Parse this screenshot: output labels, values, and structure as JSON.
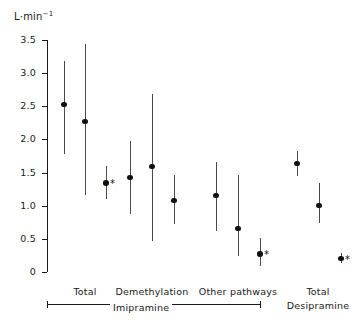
{
  "chart_data": {
    "type": "scatter",
    "title": "",
    "subtitle": "",
    "xlabel": "",
    "ylabel": "L·min⁻¹",
    "ylim": [
      0,
      3.5
    ],
    "yticks": [
      "0",
      "0.5",
      "1.0",
      "1.5",
      "2.0",
      "2.5",
      "3.0",
      "3.5"
    ],
    "ytick_values": [
      0,
      0.5,
      1.0,
      1.5,
      2.0,
      2.5,
      3.0,
      3.5
    ],
    "grid": false,
    "legend": "none",
    "error_bar_style": "vertical line, mean with range",
    "significance_marker": "*",
    "categories": [
      "Total",
      "Demethylation",
      "Other pathways",
      "Total"
    ],
    "group_brackets": [
      {
        "label": "Imipramine",
        "categories": [
          "Total",
          "Demethylation",
          "Other pathways"
        ]
      },
      {
        "label": "Desipramine",
        "categories": [
          "Total"
        ]
      }
    ],
    "series": [
      {
        "name": "Imipramine — Total",
        "points": [
          {
            "index": 1,
            "value": 2.53,
            "low": 1.78,
            "high": 3.19,
            "marker": "circle",
            "significant": false
          },
          {
            "index": 2,
            "value": 2.27,
            "low": 1.16,
            "high": 3.44,
            "marker": "circle",
            "significant": false
          },
          {
            "index": 3,
            "value": 1.34,
            "low": 1.1,
            "high": 1.6,
            "marker": "circle",
            "significant": true
          }
        ]
      },
      {
        "name": "Imipramine — Demethylation",
        "points": [
          {
            "index": 1,
            "value": 1.43,
            "low": 0.88,
            "high": 1.97,
            "marker": "circle",
            "significant": false
          },
          {
            "index": 2,
            "value": 1.59,
            "low": 0.46,
            "high": 2.68,
            "marker": "circle",
            "significant": false
          },
          {
            "index": 3,
            "value": 1.08,
            "low": 0.72,
            "high": 1.47,
            "marker": "circle",
            "significant": false
          }
        ]
      },
      {
        "name": "Imipramine — Other pathways",
        "points": [
          {
            "index": 1,
            "value": 1.15,
            "low": 0.62,
            "high": 1.66,
            "marker": "circle",
            "significant": false
          },
          {
            "index": 2,
            "value": 0.66,
            "low": 0.24,
            "high": 1.47,
            "marker": "circle",
            "significant": false
          },
          {
            "index": 3,
            "value": 0.27,
            "low": 0.09,
            "high": 0.52,
            "marker": "circle",
            "significant": true
          }
        ]
      },
      {
        "name": "Desipramine — Total",
        "points": [
          {
            "index": 1,
            "value": 1.64,
            "low": 1.45,
            "high": 1.83,
            "marker": "circle",
            "significant": false
          },
          {
            "index": 2,
            "value": 1.0,
            "low": 0.74,
            "high": 1.35,
            "marker": "circle",
            "significant": false
          },
          {
            "index": 3,
            "value": 0.2,
            "low": 0.13,
            "high": 0.28,
            "marker": "circle",
            "significant": true
          }
        ]
      }
    ]
  },
  "axis": {
    "unit_label": "L·min",
    "unit_exponent": "−1",
    "ticks": [
      {
        "label": "3.5",
        "value": 3.5
      },
      {
        "label": "3.0",
        "value": 3.0
      },
      {
        "label": "2.5",
        "value": 2.5
      },
      {
        "label": "2.0",
        "value": 2.0
      },
      {
        "label": "1.5",
        "value": 1.5
      },
      {
        "label": "1.0",
        "value": 1.0
      },
      {
        "label": "0.5",
        "value": 0.5
      },
      {
        "label": "0",
        "value": 0
      }
    ]
  },
  "labels": {
    "cat_total_imi": "Total",
    "cat_demethylation": "Demethylation",
    "cat_other_pathways": "Other pathways",
    "cat_total_desi": "Total",
    "bracket_imipramine": "Imipramine",
    "group_desipramine": "Desipramine",
    "significance_star": "*"
  }
}
